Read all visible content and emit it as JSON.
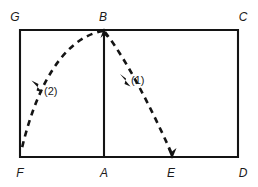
{
  "figure": {
    "type": "physics-trajectory-diagram",
    "background_color": "#ffffff",
    "stroke_color": "#141414",
    "labels": {
      "G": "G",
      "B": "B",
      "C": "C",
      "F": "F",
      "A": "A",
      "E": "E",
      "D": "D",
      "path_one": "(1)",
      "path_two": "(2)"
    },
    "vertices": [
      {
        "name": "G",
        "label": "G",
        "x": 20,
        "y": 30,
        "label_x": 15,
        "label_y": 21
      },
      {
        "name": "B",
        "label": "B",
        "x": 104,
        "y": 30,
        "label_x": 103,
        "label_y": 21
      },
      {
        "name": "C",
        "label": "C",
        "x": 238,
        "y": 30,
        "label_x": 243,
        "label_y": 21
      },
      {
        "name": "F",
        "label": "F",
        "x": 20,
        "y": 157,
        "label_x": 20,
        "label_y": 175
      },
      {
        "name": "A",
        "label": "A",
        "x": 104,
        "y": 157,
        "label_x": 104,
        "label_y": 175
      },
      {
        "name": "E",
        "label": "E",
        "x": 172,
        "y": 157,
        "label_x": 171,
        "label_y": 175
      },
      {
        "name": "D",
        "label": "D",
        "x": 238,
        "y": 157,
        "label_x": 243,
        "label_y": 175
      }
    ],
    "rectangle": {
      "left": 20,
      "top": 30,
      "right": 238,
      "bottom": 157,
      "corners": "G-B-C-D-E-A-F"
    },
    "divider": {
      "from": "B",
      "to": "A",
      "x": 104,
      "y1": 30,
      "y2": 157
    },
    "trajectories": [
      {
        "id": "1",
        "label": "(1)",
        "from": "B",
        "to": "E",
        "style": "dashed",
        "arrows": [
          "at-B-upward",
          "at-E-downward",
          "mid-toward-B"
        ],
        "label_x": 131,
        "label_y": 84
      },
      {
        "id": "2",
        "label": "(2)",
        "from": "B",
        "to": "F",
        "style": "dashed",
        "arrows": [
          "mid-toward-F"
        ],
        "label_x": 44,
        "label_y": 95
      }
    ]
  }
}
